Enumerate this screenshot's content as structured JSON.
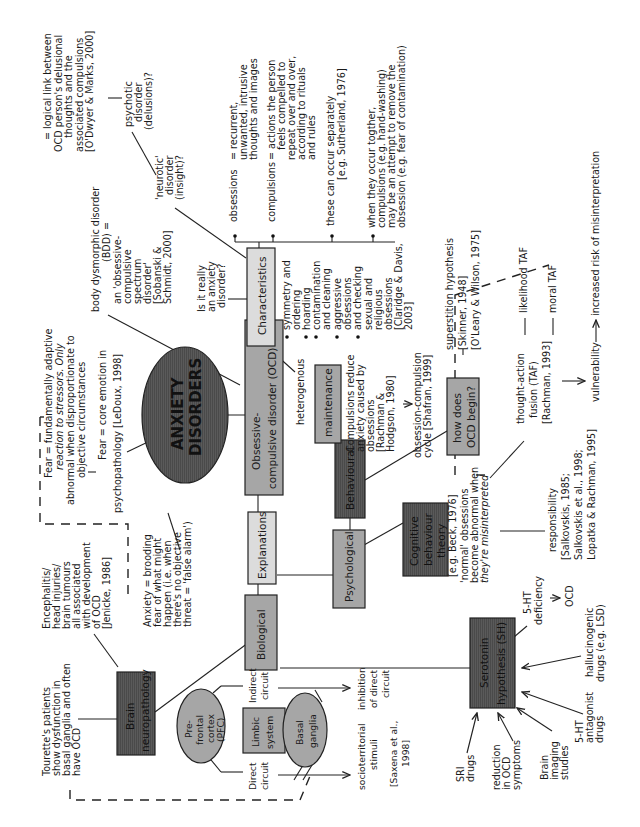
{
  "diagram": {
    "title": [
      "ANXIETY",
      "DISORDERS"
    ],
    "orientation": "rotated 90 degrees counterclockwise",
    "colors": {
      "light_box": "#dcdcdc",
      "mid_box": "#a6a6a6",
      "dark_box": "#5a5a5a",
      "ellipse": "#5a5a5a",
      "line": "#222222"
    },
    "nodes": {
      "ocd": [
        "Obsessive-",
        "compulsive disorder (OCD)"
      ],
      "characteristics": "Characteristics",
      "explanations": "Explanations",
      "biological": "Biological",
      "psychological": "Psychological",
      "behavioural": "Behavioural",
      "maintenance": "maintenance",
      "how_begin": [
        "how does",
        "OCD begin?"
      ],
      "cbt": [
        "Cognitive",
        "behaviour",
        "theory"
      ],
      "brain_neuro": [
        "Brain",
        "neuropathology"
      ],
      "serotonin": [
        "Serotonin",
        "hypothesis (SH)"
      ],
      "pfc": [
        "Pre-",
        "frontal",
        "cortex",
        "(PFC)"
      ],
      "limbic": [
        "Limbic",
        "system"
      ],
      "basal": [
        "Basal",
        "ganglia"
      ]
    },
    "fear_notes": {
      "adaptive": [
        "Fear = fundamentally adaptive",
        "reaction to stressors. Only",
        "abnormal when disproportionate to",
        "objective circumstances"
      ],
      "core": [
        "Fear = core emotion in",
        "psychopathology [LeDoux, 1998]"
      ],
      "anxiety": [
        "Anxiety = brooding",
        "fear of what might",
        "happen (i.e. when",
        "there's no objective",
        "threat = 'false alarm')"
      ]
    },
    "characteristics_notes": {
      "bdd": [
        "body dysmorphic disorder",
        "(BDD) =",
        "an 'obsessive-",
        "compulsive",
        "spectrum",
        "disorder'",
        "[Sobanski &",
        "Schmidt, 2000]"
      ],
      "anxiety_q": [
        "Is it really",
        "an anxiety",
        "disorder?"
      ],
      "neurotic": [
        "'neurotic'",
        "disorder",
        "(insight)?"
      ],
      "psychotic": [
        "psychotic",
        "disorder",
        "(delusions)?"
      ],
      "logical": [
        "= logical link between",
        "OCD person's delusional",
        "thoughts and the",
        "associated compulsions",
        "[O'Dwyer & Marks, 2000]"
      ],
      "obsessions_label": "obsessions",
      "obsessions_def": [
        "= recurrent,",
        "unwanted, intrusive",
        "thoughts and images"
      ],
      "compulsions_label": "compulsions",
      "compulsions_def": [
        "= actions the person",
        "feels compelled to",
        "repeat over and over,",
        "according to rituals",
        "and rules"
      ],
      "separately": [
        "these can occur separately",
        "[e.g. Sutherland, 1976]"
      ],
      "together": [
        "when they occur togther,",
        "compulsions (e.g. hand-washing)",
        "may be an attempt to remove the",
        "obsession (e.g. fear of contamination)"
      ],
      "heterogenous": "heterogenous",
      "types": [
        "symmetry and",
        "ordering",
        "hoarding",
        "contamination",
        "and cleaning",
        "aggressive",
        "obsessions",
        "and checking",
        "sexual and",
        "religious",
        "obsessions",
        "[Claridge & Davis,",
        "2003]"
      ]
    },
    "behavioural_notes": {
      "compulsions_reduce": [
        "Compulsions reduce",
        "anxiety caused by",
        "obsessions",
        "[Rachman &",
        "Hodgson, 1980]"
      ],
      "cycle": [
        "obsession-compulsion",
        "cycle [Shafran, 1999]"
      ],
      "superstition": [
        "superstition hypothesis",
        "[Skinner, 1948]",
        "[O'Leary & Wilson, 1975]"
      ]
    },
    "cognitive_notes": {
      "beck": "[e.g. Beck, 1976]",
      "normal": [
        "'normal' obsessions",
        "become abnormal when",
        "they're misinterpreted"
      ],
      "taf": [
        "thought-action",
        "fusion (TAF)",
        "[Rachman, 1993]"
      ],
      "likelihood": "likelihood TAF",
      "moral": "moral TAF",
      "vulnerability": "vulnerability",
      "increased_risk": "increased risk of misinterpretation",
      "responsibility": [
        "responsibility",
        "[Salkovskis, 1985;",
        "Salkovskis et al., 1998;",
        "Lopatka & Rachman, 1995]"
      ]
    },
    "biological_notes": {
      "tourette": [
        "Tourette's patients",
        "show dysfunction in",
        "basal ganglia and often",
        "have OCD"
      ],
      "encephalitis": [
        "Encephalitis/",
        "head injuries/",
        "brain tumours",
        "all associated",
        "with development",
        "of OCD",
        "[Jenicke, 1986]"
      ],
      "direct": [
        "Direct",
        "circuit"
      ],
      "indirect": [
        "Indirect",
        "circuit"
      ],
      "socio": [
        "socioterritorial",
        "stimuli"
      ],
      "saxena": [
        "[Saxena et al.,",
        "1998]"
      ],
      "inhibition": [
        "inhibition",
        "of direct",
        "circuit"
      ]
    },
    "serotonin_notes": {
      "deficiency": [
        "5-HT",
        "deficiency"
      ],
      "ocd": "OCD",
      "halluc": [
        "hallucinogenic",
        "drugs (e.g. LSD)"
      ],
      "antagonist": [
        "5-HT",
        "antagonist",
        "drugs"
      ],
      "imaging": [
        "Brain",
        "imaging",
        "studies"
      ],
      "reduction": [
        "reduction",
        "in OCD",
        "symptoms"
      ],
      "sri": [
        "SRI",
        "drugs"
      ]
    }
  }
}
